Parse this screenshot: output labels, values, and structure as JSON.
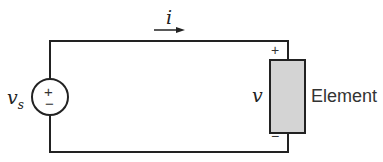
{
  "diagram": {
    "type": "circuit",
    "source_label": "v",
    "source_subscript": "s",
    "source_plus": "+",
    "source_minus": "−",
    "current_label": "i",
    "element_voltage_label": "v",
    "element_plus": "+",
    "element_minus": "−",
    "element_label": "Element",
    "colors": {
      "wire": "#222222",
      "element_fill": "#d4d4d4"
    }
  }
}
